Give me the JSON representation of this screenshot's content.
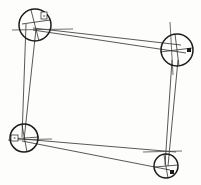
{
  "figure": {
    "background_color": "#fdfdfc",
    "ink_color": "#1b1b1b",
    "line_color": "#3a3a3a",
    "width": 201,
    "height": 185
  },
  "stations": [
    {
      "id": "station-top-left",
      "label": "A",
      "cx": 35,
      "cy": 25,
      "r": 16,
      "stroke_width": 1.5,
      "marker": {
        "type": "square-box",
        "x": 41,
        "y": 12,
        "w": 6,
        "h": 7,
        "text": "x"
      },
      "axis": {
        "orientation": "horizontal",
        "x1": 12,
        "y1": 30,
        "x2": 73,
        "y2": 29
      },
      "cross": [
        {
          "x1": 22,
          "y1": 24,
          "x2": 50,
          "y2": 20
        },
        {
          "x1": 31,
          "y1": 10,
          "x2": 39,
          "y2": 41
        }
      ]
    },
    {
      "id": "station-top-right",
      "label": "B",
      "cx": 177,
      "cy": 50,
      "r": 16,
      "stroke_width": 1.5,
      "marker": {
        "type": "small-square",
        "x": 187,
        "y": 48,
        "w": 4,
        "h": 4,
        "text": ""
      },
      "axis": {
        "orientation": "vertical",
        "x1": 170,
        "y1": 22,
        "x2": 173,
        "y2": 75
      },
      "cross": [
        {
          "x1": 160,
          "y1": 52,
          "x2": 192,
          "y2": 48
        },
        {
          "x1": 175,
          "y1": 34,
          "x2": 179,
          "y2": 66
        }
      ]
    },
    {
      "id": "station-bottom-left",
      "label": "C",
      "cx": 24,
      "cy": 138,
      "r": 14,
      "stroke_width": 1.5,
      "marker": {
        "type": "square-box",
        "x": 11,
        "y": 135,
        "w": 7,
        "h": 6,
        "text": "x"
      },
      "axis": {
        "orientation": "horizontal",
        "x1": 8,
        "y1": 140,
        "x2": 52,
        "y2": 139
      },
      "cross": [
        {
          "x1": 11,
          "y1": 139,
          "x2": 39,
          "y2": 137
        },
        {
          "x1": 22,
          "y1": 125,
          "x2": 27,
          "y2": 152
        }
      ]
    },
    {
      "id": "station-bottom-right",
      "label": "D",
      "cx": 166,
      "cy": 166,
      "r": 12,
      "stroke_width": 1.5,
      "marker": {
        "type": "small-square",
        "x": 170,
        "y": 170,
        "w": 4,
        "h": 4,
        "text": ""
      },
      "axis": {
        "orientation": "horizontal",
        "x1": 143,
        "y1": 152,
        "x2": 182,
        "y2": 151
      },
      "cross": [
        {
          "x1": 155,
          "y1": 167,
          "x2": 178,
          "y2": 165
        },
        {
          "x1": 164,
          "y1": 155,
          "x2": 168,
          "y2": 178
        }
      ]
    }
  ],
  "sight_lines": [
    {
      "id": "top-upper",
      "from": "station-top-left",
      "to": "station-top-right",
      "x1": 33,
      "y1": 28,
      "x2": 181,
      "y2": 45
    },
    {
      "id": "top-lower",
      "from": "station-top-left",
      "to": "station-top-right",
      "x1": 33,
      "y1": 30,
      "x2": 186,
      "y2": 53
    },
    {
      "id": "right-outer",
      "from": "station-top-right",
      "to": "station-bottom-right",
      "x1": 172,
      "y1": 60,
      "x2": 165,
      "y2": 165
    },
    {
      "id": "right-inner",
      "from": "station-top-right",
      "to": "station-bottom-right",
      "x1": 178,
      "y1": 60,
      "x2": 168,
      "y2": 166
    },
    {
      "id": "bottom-upper",
      "from": "station-bottom-left",
      "to": "station-bottom-right",
      "x1": 22,
      "y1": 139,
      "x2": 176,
      "y2": 152
    },
    {
      "id": "bottom-lower",
      "from": "station-bottom-left",
      "to": "station-bottom-right",
      "x1": 22,
      "y1": 141,
      "x2": 170,
      "y2": 170
    },
    {
      "id": "left-outer",
      "from": "station-top-left",
      "to": "station-bottom-left",
      "x1": 26,
      "y1": 24,
      "x2": 22,
      "y2": 137
    },
    {
      "id": "left-inner",
      "from": "station-top-left",
      "to": "station-bottom-left",
      "x1": 36,
      "y1": 29,
      "x2": 24,
      "y2": 140
    }
  ]
}
